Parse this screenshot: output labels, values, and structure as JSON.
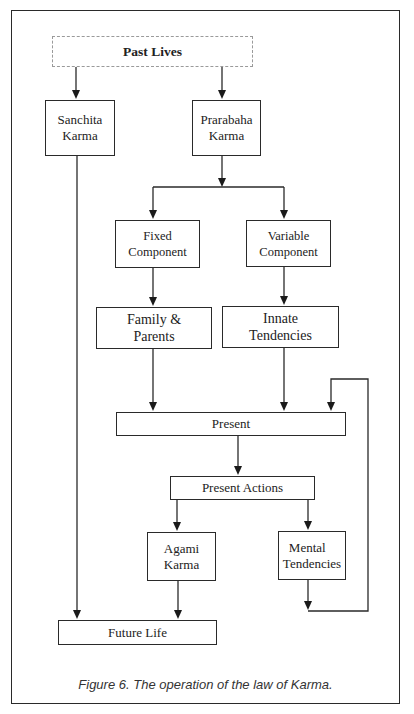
{
  "diagram": {
    "nodes": {
      "past_lives": "Past Lives",
      "sanchita_karma": [
        "Sanchita",
        "Karma"
      ],
      "prarabaha_karma": [
        "Prarabaha",
        "Karma"
      ],
      "fixed_component": [
        "Fixed",
        "Component"
      ],
      "variable_component": [
        "Variable",
        "Component"
      ],
      "family_parents": [
        "Family &",
        "Parents"
      ],
      "innate_tendencies": [
        "Innate",
        "Tendencies"
      ],
      "present": "Present",
      "present_actions": "Present Actions",
      "agami_karma": [
        "Agami",
        "Karma"
      ],
      "mental_tendencies": [
        "Mental",
        "Tendencies"
      ],
      "future_life": "Future Life"
    },
    "edges": [
      [
        "Past Lives",
        "Sanchita Karma"
      ],
      [
        "Past Lives",
        "Prarabaha Karma"
      ],
      [
        "Prarabaha Karma",
        "Fixed Component"
      ],
      [
        "Prarabaha Karma",
        "Variable Component"
      ],
      [
        "Fixed Component",
        "Family & Parents"
      ],
      [
        "Variable Component",
        "Innate Tendencies"
      ],
      [
        "Family & Parents",
        "Present"
      ],
      [
        "Innate Tendencies",
        "Present"
      ],
      [
        "Mental Tendencies",
        "Present"
      ],
      [
        "Present",
        "Present Actions"
      ],
      [
        "Present Actions",
        "Agami Karma"
      ],
      [
        "Present Actions",
        "Mental Tendencies"
      ],
      [
        "Agami Karma",
        "Future Life"
      ],
      [
        "Sanchita Karma",
        "Future Life"
      ]
    ],
    "caption": "Figure 6. The operation of the law of Karma."
  }
}
